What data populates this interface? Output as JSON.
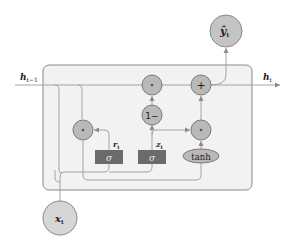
{
  "diagram": {
    "colors": {
      "cell_fill": "#f2f2f2",
      "cell_border": "#8a8a8a",
      "node_fill": "#b9b9b9",
      "node_border": "#7a7a7a",
      "gate_fill": "#6b6b6b",
      "line": "#9a9a9a"
    },
    "labels": {
      "h_prev": "h",
      "h_prev_sub": "t−1",
      "h_t": "h",
      "h_t_sub": "t",
      "y_hat": "ŷ",
      "y_hat_sub": "t",
      "x_t": "x",
      "x_t_sub": "t",
      "r_t": "r",
      "r_t_sub": "t",
      "z_t": "z",
      "z_t_sub": "t"
    },
    "nodes": {
      "mult_top": "∘",
      "add": "+",
      "one_minus": "1−",
      "mult_reset": "∘",
      "mult_candidate": "∘",
      "sigma_r": "σ",
      "sigma_z": "σ",
      "tanh": "tanh"
    }
  }
}
